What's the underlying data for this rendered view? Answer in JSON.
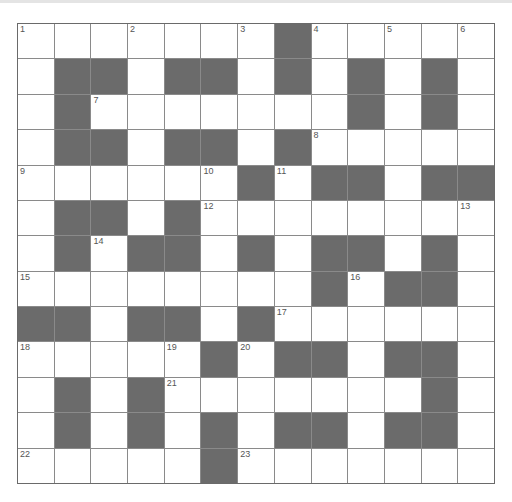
{
  "puzzle": {
    "rows": 13,
    "cols": 13,
    "colors": {
      "block": "#6b6b6b",
      "cell": "#ffffff",
      "line": "#8a8a8a"
    },
    "grid": [
      ".......#.....",
      ".##.##.#.#.#.",
      ".#.......#.#.",
      ".##.##.#.....",
      "......#.##.##",
      ".##.#........",
      ".#.##.#.##.#.",
      "........#.##.",
      "##.##.#......",
      ".....#.##.##.",
      ".#.#.......#.",
      ".#.#.#.##.##.",
      ".....#......."
    ],
    "numbers": [
      {
        "r": 0,
        "c": 0,
        "n": "1"
      },
      {
        "r": 0,
        "c": 3,
        "n": "2"
      },
      {
        "r": 0,
        "c": 6,
        "n": "3"
      },
      {
        "r": 0,
        "c": 8,
        "n": "4"
      },
      {
        "r": 0,
        "c": 10,
        "n": "5"
      },
      {
        "r": 0,
        "c": 12,
        "n": "6"
      },
      {
        "r": 2,
        "c": 2,
        "n": "7"
      },
      {
        "r": 3,
        "c": 8,
        "n": "8"
      },
      {
        "r": 4,
        "c": 0,
        "n": "9"
      },
      {
        "r": 4,
        "c": 5,
        "n": "10"
      },
      {
        "r": 4,
        "c": 7,
        "n": "11"
      },
      {
        "r": 5,
        "c": 5,
        "n": "12"
      },
      {
        "r": 5,
        "c": 12,
        "n": "13"
      },
      {
        "r": 6,
        "c": 2,
        "n": "14"
      },
      {
        "r": 7,
        "c": 0,
        "n": "15"
      },
      {
        "r": 7,
        "c": 9,
        "n": "16"
      },
      {
        "r": 8,
        "c": 7,
        "n": "17"
      },
      {
        "r": 9,
        "c": 0,
        "n": "18"
      },
      {
        "r": 9,
        "c": 4,
        "n": "19"
      },
      {
        "r": 9,
        "c": 6,
        "n": "20"
      },
      {
        "r": 10,
        "c": 4,
        "n": "21"
      },
      {
        "r": 12,
        "c": 0,
        "n": "22"
      },
      {
        "r": 12,
        "c": 6,
        "n": "23"
      }
    ]
  }
}
